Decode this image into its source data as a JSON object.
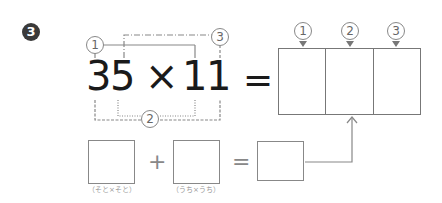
{
  "problem": {
    "number_badge": "3",
    "expression": {
      "left_operand": [
        "3",
        "5"
      ],
      "operator": "×",
      "right_operand": [
        "1",
        "1"
      ],
      "equals": "="
    },
    "bracket_labels": {
      "outer_pair": "1",
      "middle_cross": "3",
      "inner_pair": "2"
    }
  },
  "answer_grid": {
    "columns": [
      {
        "label": "1",
        "value": ""
      },
      {
        "label": "2",
        "value": ""
      },
      {
        "label": "3",
        "value": ""
      }
    ]
  },
  "sub_equation": {
    "box1": {
      "value": "",
      "caption": "（そと×そと）"
    },
    "plus": "+",
    "box2": {
      "value": "",
      "caption": "（うち×うち）"
    },
    "equals": "=",
    "box3": {
      "value": ""
    }
  },
  "colors": {
    "text": "#1a1a1a",
    "lines": "#888888",
    "badge": "#3a3a3a"
  }
}
